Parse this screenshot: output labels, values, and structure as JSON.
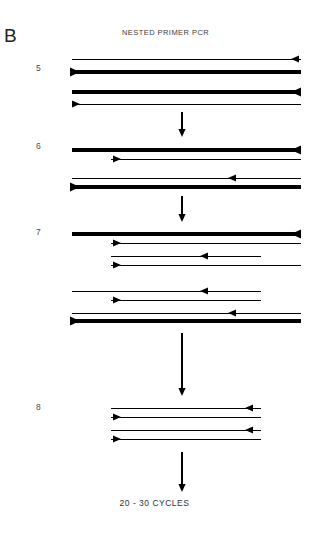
{
  "figure": {
    "panel_letter": "B",
    "title": "NESTED PRIMER PCR",
    "footer_label": "20 - 30 CYCLES",
    "width": 309,
    "height": 537,
    "background_color": "#ffffff",
    "stroke_color": "#000000"
  },
  "steps": [
    {
      "id": "step-5",
      "number": "5",
      "label_x": 36,
      "label_y": 64
    },
    {
      "id": "step-6",
      "number": "6",
      "label_x": 36,
      "label_y": 142
    },
    {
      "id": "step-7",
      "number": "7",
      "label_x": 36,
      "label_y": 228
    },
    {
      "id": "step-8",
      "number": "8",
      "label_x": 36,
      "label_y": 403
    }
  ],
  "chart_data": {
    "type": "diagram",
    "title": "NESTED PRIMER PCR",
    "panel": "B",
    "annotation": "20 - 30 CYCLES",
    "strands": [
      {
        "step": 5,
        "group": 1,
        "x1": 72,
        "x2": 301,
        "y": 59,
        "weight": "thin",
        "arrow": "left",
        "arrow_x": 291
      },
      {
        "step": 5,
        "group": 1,
        "x1": 70,
        "x2": 301,
        "y": 72,
        "weight": "thick",
        "arrow": "right",
        "arrow_x": 80
      },
      {
        "step": 5,
        "group": 2,
        "x1": 72,
        "x2": 301,
        "y": 92,
        "weight": "thick",
        "arrow": "left",
        "arrow_x": 291
      },
      {
        "step": 5,
        "group": 2,
        "x1": 72,
        "x2": 301,
        "y": 104,
        "weight": "thin",
        "arrow": "right",
        "arrow_x": 80
      },
      {
        "step": 6,
        "group": 1,
        "x1": 72,
        "x2": 301,
        "y": 150,
        "weight": "thick",
        "arrow": "left",
        "arrow_x": 291
      },
      {
        "step": 6,
        "group": 1,
        "x1": 111,
        "x2": 301,
        "y": 159,
        "weight": "thin",
        "arrow": "right",
        "arrow_x": 121
      },
      {
        "step": 6,
        "group": 2,
        "x1": 72,
        "x2": 301,
        "y": 178,
        "weight": "thin",
        "arrow": "left",
        "arrow_x": 228
      },
      {
        "step": 6,
        "group": 2,
        "x1": 72,
        "x2": 301,
        "y": 187,
        "weight": "thick",
        "arrow": "right",
        "arrow_x": 80
      },
      {
        "step": 7,
        "group": 1,
        "x1": 72,
        "x2": 301,
        "y": 234,
        "weight": "thick",
        "arrow": "left",
        "arrow_x": 291
      },
      {
        "step": 7,
        "group": 1,
        "x1": 111,
        "x2": 301,
        "y": 243,
        "weight": "thin",
        "arrow": "right",
        "arrow_x": 121
      },
      {
        "step": 7,
        "group": 2,
        "x1": 111,
        "x2": 261,
        "y": 256,
        "weight": "thin",
        "arrow": "left",
        "arrow_x": 200
      },
      {
        "step": 7,
        "group": 2,
        "x1": 111,
        "x2": 301,
        "y": 265,
        "weight": "thin",
        "arrow": "right",
        "arrow_x": 121
      },
      {
        "step": 7,
        "group": 3,
        "x1": 111,
        "x2": 261,
        "y": 256,
        "weight": "none",
        "arrow": "none",
        "arrow_x": 0
      },
      {
        "step": 7,
        "group": 4,
        "x1": 72,
        "x2": 261,
        "y": 291,
        "weight": "thin",
        "arrow": "left",
        "arrow_x": 200
      },
      {
        "step": 7,
        "group": 4,
        "x1": 111,
        "x2": 261,
        "y": 300,
        "weight": "thin",
        "arrow": "right",
        "arrow_x": 121
      },
      {
        "step": 7,
        "group": 5,
        "x1": 72,
        "x2": 301,
        "y": 313,
        "weight": "thin",
        "arrow": "left",
        "arrow_x": 228
      },
      {
        "step": 7,
        "group": 5,
        "x1": 70,
        "x2": 301,
        "y": 321,
        "weight": "thick",
        "arrow": "right",
        "arrow_x": 80
      },
      {
        "step": 8,
        "group": 1,
        "x1": 111,
        "x2": 261,
        "y": 408,
        "weight": "thin",
        "arrow": "left",
        "arrow_x": 245
      },
      {
        "step": 8,
        "group": 1,
        "x1": 111,
        "x2": 261,
        "y": 417,
        "weight": "thin",
        "arrow": "right",
        "arrow_x": 121
      },
      {
        "step": 8,
        "group": 2,
        "x1": 111,
        "x2": 261,
        "y": 430,
        "weight": "thin",
        "arrow": "left",
        "arrow_x": 245
      },
      {
        "step": 8,
        "group": 2,
        "x1": 111,
        "x2": 261,
        "y": 439,
        "weight": "thin",
        "arrow": "right",
        "arrow_x": 121
      }
    ],
    "flow_arrows": [
      {
        "id": "arrow-5-to-6",
        "x": 182,
        "y1": 112,
        "y2": 137
      },
      {
        "id": "arrow-6-to-7",
        "x": 182,
        "y1": 196,
        "y2": 222
      },
      {
        "id": "arrow-7-to-8",
        "x": 182,
        "y1": 333,
        "y2": 396
      },
      {
        "id": "arrow-8-to-cycles",
        "x": 182,
        "y1": 452,
        "y2": 492
      }
    ]
  }
}
